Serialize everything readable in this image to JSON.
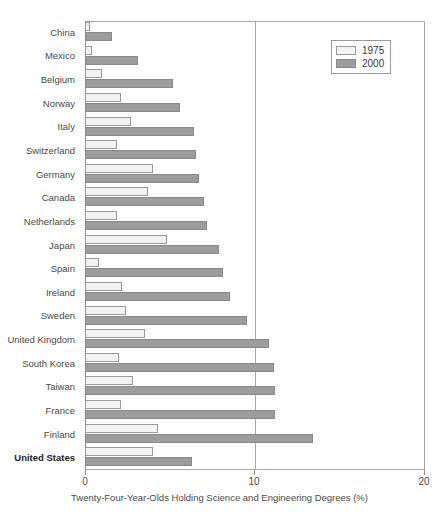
{
  "chart_data": {
    "type": "bar",
    "orientation": "horizontal",
    "title": "",
    "xlabel": "Twenty-Four-Year-Olds Holding Science and Engineering Degrees (%)",
    "ylabel": "",
    "xlim": [
      0,
      20
    ],
    "xticks": [
      "0",
      "10",
      "20"
    ],
    "xtick_values": [
      0,
      10,
      20
    ],
    "grid": "vertical gridline at 10",
    "legend_position": "top-right",
    "categories": [
      "China",
      "Mexico",
      "Belgium",
      "Norway",
      "Italy",
      "Switzerland",
      "Germany",
      "Canada",
      "Netherlands",
      "Japan",
      "Spain",
      "Ireland",
      "Sweden",
      "United Kingdom",
      "South Korea",
      "Taiwan",
      "France",
      "Finland",
      "United States"
    ],
    "highlight_category": "United States",
    "series": [
      {
        "name": "1975",
        "color": "#f2f2f2",
        "values": [
          0.3,
          0.4,
          1.0,
          2.1,
          2.7,
          1.9,
          4.0,
          3.7,
          1.9,
          4.8,
          0.8,
          2.2,
          2.4,
          3.5,
          2.0,
          2.8,
          2.1,
          4.3,
          4.0
        ]
      },
      {
        "name": "2000",
        "color": "#9d9d9d",
        "values": [
          1.6,
          3.1,
          5.2,
          5.6,
          6.4,
          6.5,
          6.7,
          7.0,
          7.2,
          7.9,
          8.1,
          8.5,
          9.5,
          10.8,
          11.1,
          11.2,
          11.2,
          13.4,
          6.3
        ]
      }
    ]
  },
  "legend": {
    "items": [
      {
        "label": "1975",
        "swatch": "light-swatch-icon"
      },
      {
        "label": "2000",
        "swatch": "dark-swatch-icon"
      }
    ]
  }
}
